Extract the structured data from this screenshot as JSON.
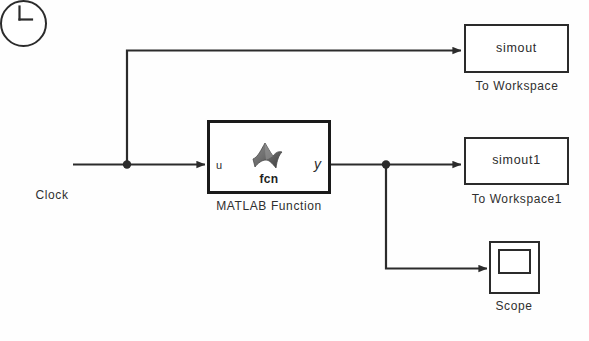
{
  "diagram": {
    "line_color": "#2b2b2b",
    "block_border_color": "#2b2b2b",
    "background_color": "#fefefe"
  },
  "blocks": {
    "clock": {
      "caption": "Clock",
      "icon": "clock-face-icon"
    },
    "matlab_function": {
      "caption": "MATLAB Function",
      "inner_label": "fcn",
      "input_port_label": "u",
      "output_port_label": "y",
      "icon": "matlab-membrane-icon"
    },
    "to_workspace": {
      "variable": "simout",
      "caption": "To Workspace"
    },
    "to_workspace1": {
      "variable": "simout1",
      "caption": "To Workspace1"
    },
    "scope": {
      "caption": "Scope",
      "icon": "scope-screen-icon"
    }
  },
  "signals": [
    {
      "name": "clock-to-fcn",
      "from": "clock",
      "to": "matlab_function"
    },
    {
      "name": "clock-to-simout",
      "from": "clock",
      "to": "to_workspace"
    },
    {
      "name": "fcn-to-simout1",
      "from": "matlab_function",
      "to": "to_workspace1"
    },
    {
      "name": "fcn-to-scope",
      "from": "matlab_function",
      "to": "scope"
    }
  ]
}
